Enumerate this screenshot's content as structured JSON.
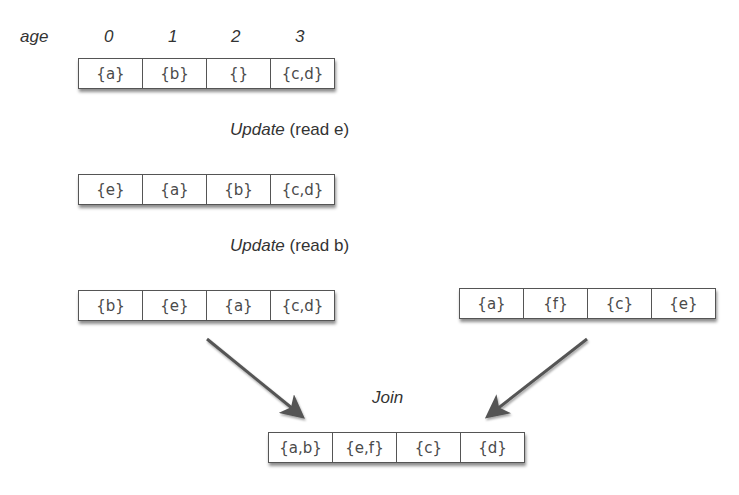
{
  "age_label": "age",
  "age_indices": [
    "0",
    "1",
    "2",
    "3"
  ],
  "rows": {
    "initial": [
      "{a}",
      "{b}",
      "{}",
      "{c,d}"
    ],
    "after_update_1": [
      "{e}",
      "{a}",
      "{b}",
      "{c,d}"
    ],
    "after_update_2": [
      "{b}",
      "{e}",
      "{a}",
      "{c,d}"
    ],
    "other": [
      "{a}",
      "{f}",
      "{c}",
      "{e}"
    ],
    "joined": [
      "{a,b}",
      "{e,f}",
      "{c}",
      "{d}"
    ]
  },
  "operations": {
    "update_1": {
      "name": "Update",
      "detail": "(read e)"
    },
    "update_2": {
      "name": "Update",
      "detail": "(read b)"
    },
    "join": "Join"
  },
  "colors": {
    "arrow": "#555555",
    "border": "#555555",
    "text": "#4a4a4a"
  }
}
